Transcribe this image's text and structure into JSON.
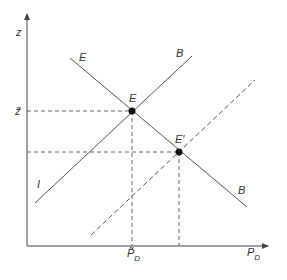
{
  "diagram": {
    "axes": {
      "y_label": "z",
      "x_label": "P",
      "x_label_sub": "D",
      "y_tick_label": "z̃",
      "x_tick_label": "P̃",
      "x_tick_label_sub": "D"
    },
    "curves": {
      "EB_label_top": "E",
      "EB_label_bottom": "B",
      "IB_label_top": "B",
      "IB_label_bottom": "I"
    },
    "points": {
      "E": "E",
      "E_prime": "E'"
    },
    "colors": {
      "line": "#555555",
      "point": "#111111",
      "axis": "#444444"
    }
  }
}
